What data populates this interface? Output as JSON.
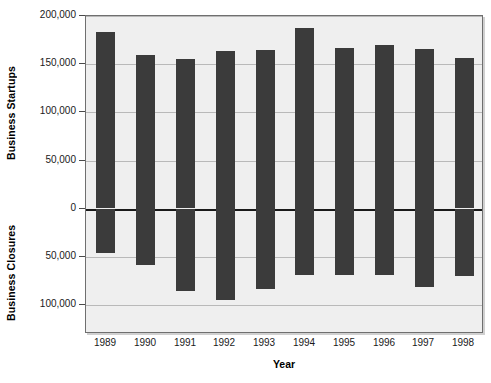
{
  "chart_data": {
    "type": "bar",
    "title": "",
    "xlabel": "Year",
    "ylabel_top": "Business Startups",
    "ylabel_bottom": "Business Closures",
    "categories": [
      "1989",
      "1990",
      "1991",
      "1992",
      "1993",
      "1994",
      "1995",
      "1996",
      "1997",
      "1998"
    ],
    "series": [
      {
        "name": "Business Startups",
        "direction": "up",
        "values": [
          183000,
          160000,
          155000,
          164000,
          165000,
          188000,
          167000,
          170000,
          166000,
          156000
        ]
      },
      {
        "name": "Business Closures",
        "direction": "down",
        "values": [
          46000,
          58000,
          85000,
          94000,
          83000,
          68000,
          69000,
          69000,
          81000,
          70000
        ]
      }
    ],
    "y_axis": {
      "ticks": [
        {
          "label": "200,000",
          "value": 200000
        },
        {
          "label": "150,000",
          "value": 150000
        },
        {
          "label": "100,000",
          "value": 100000
        },
        {
          "label": "50,000",
          "value": 50000
        },
        {
          "label": "0",
          "value": 0
        },
        {
          "label": "50,000",
          "value": -50000
        },
        {
          "label": "100,000",
          "value": -100000
        }
      ],
      "ylim": [
        -130000,
        200000
      ]
    },
    "grid": true,
    "legend": "none",
    "bar_color": "#3b3b3b",
    "plot_background": "#efefef",
    "gridline_color": "#b9b9b9",
    "zero_line_color": "#1a1a1a"
  }
}
